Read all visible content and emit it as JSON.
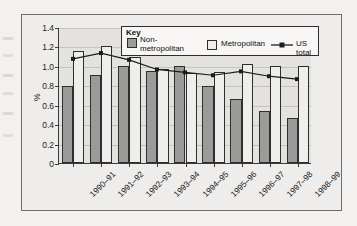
{
  "figure": {
    "y_axis_title": "%"
  },
  "legend": {
    "title": "Key",
    "items": [
      {
        "label": "Non-\nmetropolitan",
        "marker": "swatch",
        "color": "#9b9b99"
      },
      {
        "label": "Metropolitan",
        "marker": "swatch",
        "color": "#efeeec"
      },
      {
        "label": "US total",
        "marker": "line-with-point",
        "color": "#1c1c1c"
      }
    ]
  },
  "chart_data": {
    "type": "bar",
    "title": "",
    "xlabel": "",
    "ylabel": "%",
    "ylim": [
      0,
      1.4
    ],
    "yticks": [
      "0",
      "0.2",
      "0.4",
      "0.6",
      "0.8",
      "1.0",
      "1.2",
      "1.4"
    ],
    "grid": true,
    "legend_position": "top-center-inside",
    "categories": [
      "1990–91",
      "1991–92",
      "1992–93",
      "1993–94",
      "1994–95",
      "1995–96",
      "1996–97",
      "1997–98",
      "1998–99"
    ],
    "series": [
      {
        "name": "Non-metropolitan",
        "type": "bar",
        "color": "#9b9b99",
        "values": [
          0.79,
          0.91,
          1.0,
          0.95,
          1.0,
          0.79,
          0.66,
          0.54,
          0.46
        ]
      },
      {
        "name": "Metropolitan",
        "type": "bar",
        "color": "#efeeec",
        "values": [
          1.15,
          1.2,
          1.09,
          0.97,
          0.93,
          0.94,
          1.02,
          1.0,
          1.0
        ]
      },
      {
        "name": "US total",
        "type": "line",
        "color": "#1c1c1c",
        "values": [
          1.08,
          1.14,
          1.07,
          0.97,
          0.94,
          0.91,
          0.95,
          0.9,
          0.87
        ]
      }
    ]
  }
}
